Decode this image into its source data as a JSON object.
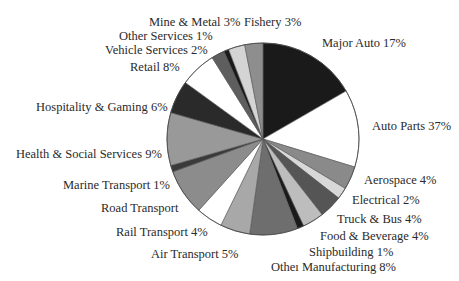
{
  "chart_data": {
    "type": "pie",
    "title": "",
    "start_angle": "12 o'clock, clockwise",
    "slices": [
      {
        "label": "Major Auto",
        "value": 17,
        "display": "Major Auto 17%",
        "color": "#1a1a1a",
        "a0": 0,
        "a1": 60
      },
      {
        "label": "Auto Parts",
        "value": 37,
        "display": "Auto Parts 37%",
        "color": "#ffffff",
        "a0": 60,
        "a1": 107
      },
      {
        "label": "Aerospace",
        "value": 4,
        "display": "Aerospace 4%",
        "color": "#8a8a8a",
        "a0": 107,
        "a1": 121
      },
      {
        "label": "Electrical",
        "value": 2,
        "display": "Electrical 2%",
        "color": "#d8d8d8",
        "a0": 121,
        "a1": 128
      },
      {
        "label": "Truck & Bus",
        "value": 4,
        "display": "Truck & Bus 4%",
        "color": "#555555",
        "a0": 128,
        "a1": 142
      },
      {
        "label": "Food & Beverage",
        "value": 4,
        "display": "Food & Beverage 4%",
        "color": "#bdbdbd",
        "a0": 142,
        "a1": 155
      },
      {
        "label": "Shipbuilding",
        "value": 1,
        "display": "Shipbuilding 1%",
        "color": "#1a1a1a",
        "a0": 155,
        "a1": 159
      },
      {
        "label": "Other Manufacturing",
        "value": 8,
        "display": "Otheı Manufacturing 8%",
        "color": "#6e6e6e",
        "a0": 159,
        "a1": 188
      },
      {
        "label": "Air Transport",
        "value": 5,
        "display": "Air Transport 5%",
        "color": "#a8a8a8",
        "a0": 188,
        "a1": 206
      },
      {
        "label": "Rail Transport",
        "value": 4,
        "display": "Rail Transport 4%",
        "color": "#ffffff",
        "a0": 206,
        "a1": 222
      },
      {
        "label": "Road Transport",
        "value": null,
        "display": "Road Transport",
        "color": "#8c8c8c",
        "a0": 222,
        "a1": 250
      },
      {
        "label": "Marine Transport",
        "value": 1,
        "display": "Marine Transport 1%",
        "color": "#3a3a3a",
        "a0": 250,
        "a1": 254
      },
      {
        "label": "Health & Social Services",
        "value": 9,
        "display": "Health & Social Services 9%",
        "color": "#999999",
        "a0": 254,
        "a1": 286
      },
      {
        "label": "Hospitality & Gaming",
        "value": 6,
        "display": "Hospitality & Gaming 6%",
        "color": "#2a2a2a",
        "a0": 286,
        "a1": 306
      },
      {
        "label": "Retail",
        "value": 8,
        "display": "Retail 8%",
        "color": "#ffffff",
        "a0": 306,
        "a1": 328
      },
      {
        "label": "Vehicle Services",
        "value": 2,
        "display": "Vehicle Services 2%",
        "color": "#5e5e5e",
        "a0": 328,
        "a1": 336
      },
      {
        "label": "Other Services",
        "value": 1,
        "display": "Other Services 1%",
        "color": "#1a1a1a",
        "a0": 336,
        "a1": 339
      },
      {
        "label": "Mine & Metal",
        "value": 3,
        "display": "Mine & Metal 3%",
        "color": "#d4d4d4",
        "a0": 339,
        "a1": 349
      },
      {
        "label": "Fishery",
        "value": 3,
        "display": "Fishery 3%",
        "color": "#8e8e8e",
        "a0": 349,
        "a1": 360
      }
    ],
    "center": [
      263,
      139
    ],
    "radius": 96,
    "legend": "none (direct labels)"
  },
  "labels": [
    {
      "text": "Major Auto 17%",
      "x": 322,
      "y": 36
    },
    {
      "text": "Auto Parts 37%",
      "x": 372,
      "y": 119
    },
    {
      "text": "Aerospace 4%",
      "x": 364,
      "y": 173
    },
    {
      "text": "Electrical 2%",
      "x": 352,
      "y": 193
    },
    {
      "text": "Truck & Bus 4%",
      "x": 337,
      "y": 212
    },
    {
      "text": "Food & Beverage 4%",
      "x": 320,
      "y": 229
    },
    {
      "text": "Shipbuilding 1%",
      "x": 309,
      "y": 245
    },
    {
      "text": "Otheı Manufacturing 8%",
      "x": 271,
      "y": 260
    },
    {
      "text": "Air Transport 5%",
      "x": 151,
      "y": 247
    },
    {
      "text": "Rail Transport 4%",
      "x": 116,
      "y": 225
    },
    {
      "text": "Road Transport",
      "x": 101,
      "y": 201
    },
    {
      "text": "Marine Transport 1%",
      "x": 63,
      "y": 178
    },
    {
      "text": "Health & Social Services 9%",
      "x": 16,
      "y": 147
    },
    {
      "text": "Hospitality & Gaming 6%",
      "x": 36,
      "y": 100
    },
    {
      "text": "Retail 8%",
      "x": 130,
      "y": 60
    },
    {
      "text": "Vehicle Services 2%",
      "x": 105,
      "y": 43
    },
    {
      "text": "Other Services 1%",
      "x": 119,
      "y": 29
    },
    {
      "text": "Mine & Metal 3%",
      "x": 149,
      "y": 15
    },
    {
      "text": "Fishery 3%",
      "x": 244,
      "y": 15
    }
  ]
}
